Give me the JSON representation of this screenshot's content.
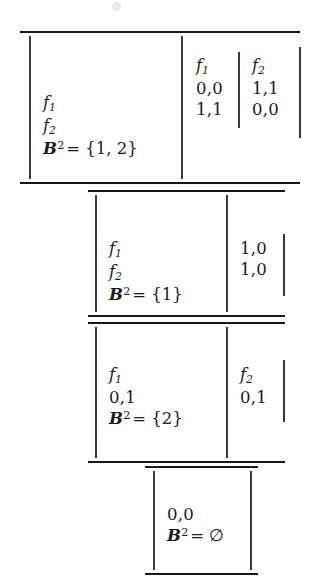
{
  "figure": {
    "symbols": {
      "f1": "f",
      "f1_sub": "1",
      "f2": "f",
      "f2_sub": "2",
      "belief_letter": "B",
      "belief_sup": "2",
      "equals": "=",
      "emptyset": "∅"
    },
    "blocks": [
      {
        "id": "block-1",
        "left_cell": {
          "rows": [
            "f1",
            "f2",
            "belief"
          ],
          "f1_label": "f",
          "f1_sub": "1",
          "f2_label": "f",
          "f2_sub": "2",
          "belief_text": "= {1, 2}"
        },
        "matrix": {
          "columns": [
            {
              "header_label": "f",
              "header_sub": "1",
              "cells": [
                "0,0",
                "1,1"
              ]
            },
            {
              "header_label": "f",
              "header_sub": "2",
              "cells": [
                "1,1",
                "0,0"
              ]
            }
          ]
        }
      },
      {
        "id": "block-2",
        "left_cell": {
          "f1_label": "f",
          "f1_sub": "1",
          "f2_label": "f",
          "f2_sub": "2",
          "belief_text": "= {1}"
        },
        "matrix": {
          "columns": [
            {
              "header_label": "",
              "header_sub": "",
              "cells": [
                "1,0",
                "1,0"
              ]
            }
          ]
        }
      },
      {
        "id": "block-3",
        "left_cell": {
          "f1_label": "f",
          "f1_sub": "1",
          "value": "0,1",
          "belief_text": "= {2}"
        },
        "matrix": {
          "columns": [
            {
              "header_label": "f",
              "header_sub": "2",
              "cells": [
                "0,1"
              ]
            }
          ]
        }
      },
      {
        "id": "block-4",
        "single_cell": {
          "value": "0,0",
          "belief_text": "= ∅"
        }
      }
    ]
  }
}
